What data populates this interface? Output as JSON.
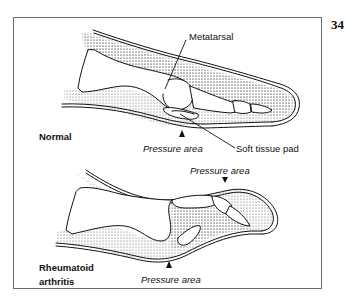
{
  "figure": {
    "number": "34",
    "panels": [
      {
        "title": "Normal",
        "labels": {
          "bone": "Metatarsal",
          "pressure": "Pressure area",
          "pad": "Soft tissue pad"
        }
      },
      {
        "title_line1": "Rheumatoid",
        "title_line2": "arthritis",
        "labels": {
          "pressure_top": "Pressure area",
          "pressure_bottom": "Pressure area"
        }
      }
    ]
  },
  "colors": {
    "line": "#111111",
    "frame": "#6e6e6e",
    "stipple": "#555555"
  }
}
